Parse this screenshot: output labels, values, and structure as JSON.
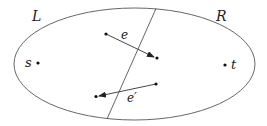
{
  "diagram": {
    "regions": {
      "left_label": "L",
      "right_label": "R"
    },
    "vertices": [
      {
        "id": "s",
        "label": "s"
      },
      {
        "id": "t",
        "label": "t"
      }
    ],
    "edges": [
      {
        "id": "e",
        "label": "e",
        "direction": "L-to-R"
      },
      {
        "id": "e_prime",
        "label": "e′",
        "direction": "R-to-L"
      }
    ],
    "colors": {
      "stroke": "#333333",
      "background": "#ffffff"
    }
  }
}
